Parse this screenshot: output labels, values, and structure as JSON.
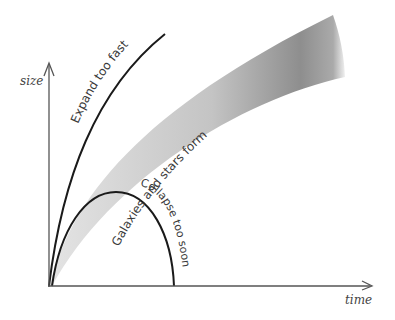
{
  "diagram": {
    "axes": {
      "x_label": "time",
      "y_label": "size"
    },
    "curves": {
      "expand": {
        "label": "Expand too fast",
        "color": "#1a1a1a"
      },
      "collapse": {
        "label": "Collapse too soon",
        "color": "#1a1a1a"
      },
      "band": {
        "label": "Galaxies and stars form",
        "color_light": "#e2e2e2",
        "color_dark": "#8a8a8a"
      }
    }
  }
}
